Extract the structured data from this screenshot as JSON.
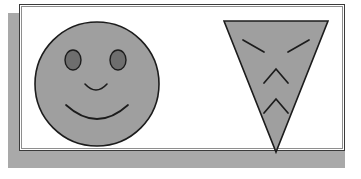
{
  "scene": {
    "title": "Two gray face shapes on a white panel",
    "background_color": "#ffffff",
    "panel": {
      "name": "white-panel",
      "fill_color": "#ffffff",
      "border_color": "#3a3a3a",
      "inner_border_color": "#8e8e8e",
      "x": 19,
      "y": 4,
      "width": 326,
      "height": 147
    },
    "shadow": {
      "name": "panel-drop-shadow",
      "color": "#a9a9a9",
      "x": 8,
      "y": 13,
      "width": 337,
      "height": 155
    }
  },
  "shapes": [
    {
      "id": "smiley-face",
      "label": "Smiling round face",
      "type": "circle",
      "fill": "#9f9f9f",
      "stroke": "#1c1c1c",
      "stroke_width": 1.6,
      "center_x": 97,
      "center_y": 84,
      "radius": 62,
      "features": [
        {
          "id": "left-eye",
          "label": "Left eye",
          "type": "ellipse",
          "cx": 73,
          "cy": 60,
          "rx": 8,
          "ry": 10,
          "fill": "#6e6e6e",
          "stroke": "#1c1c1c"
        },
        {
          "id": "right-eye",
          "label": "Right eye",
          "type": "ellipse",
          "cx": 118,
          "cy": 60,
          "rx": 8,
          "ry": 10,
          "fill": "#6e6e6e",
          "stroke": "#1c1c1c"
        },
        {
          "id": "nose",
          "label": "Nose arc",
          "type": "arc",
          "path": "M 85 84 Q 96 96 107 84"
        },
        {
          "id": "mouth",
          "label": "Smiling mouth arc",
          "type": "arc",
          "path": "M 66 105 Q 97 133 128 105"
        }
      ]
    },
    {
      "id": "angry-triangle-face",
      "label": "Angry downward triangle face",
      "type": "triangle",
      "fill": "#9f9f9f",
      "stroke": "#1c1c1c",
      "stroke_width": 1.6,
      "points": "224,21 328,21 276,152",
      "features": [
        {
          "id": "left-brow",
          "label": "Left angled brow",
          "type": "line",
          "x1": 243,
          "y1": 40,
          "x2": 264,
          "y2": 52
        },
        {
          "id": "right-brow",
          "label": "Right angled brow",
          "type": "line",
          "x1": 309,
          "y1": 40,
          "x2": 288,
          "y2": 52
        },
        {
          "id": "upper-chevron",
          "label": "Upper chevron",
          "type": "polyline",
          "path": "M 264 83 L 276 69 L 288 83"
        },
        {
          "id": "lower-chevron",
          "label": "Lower chevron",
          "type": "polyline",
          "path": "M 264 113 L 276 99 L 288 113"
        }
      ]
    }
  ]
}
